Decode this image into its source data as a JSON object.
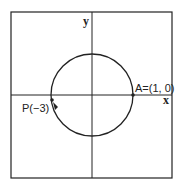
{
  "diagram": {
    "axes": {
      "x_label": "x",
      "y_label": "y"
    },
    "circle": {
      "type": "unit circle",
      "radius": 1
    },
    "points": [
      {
        "name": "A",
        "label": "A=(1, 0)",
        "coords": [
          1,
          0
        ]
      },
      {
        "name": "P",
        "label": "P(−3)",
        "arc_length": -3
      }
    ],
    "colors": {
      "stroke": "#222222",
      "background": "#ffffff"
    }
  }
}
